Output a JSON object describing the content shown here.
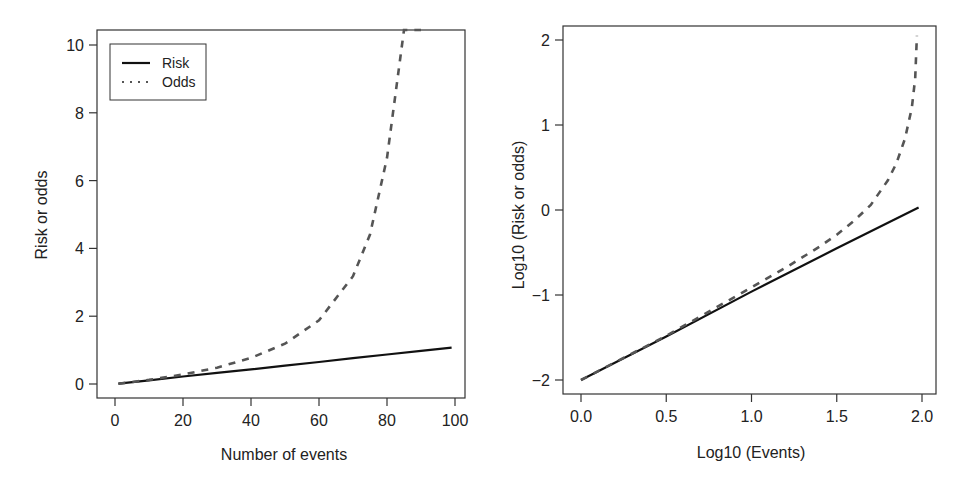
{
  "colors": {
    "risk": "#111111",
    "odds": "#555555",
    "axis": "#333333"
  },
  "chart_data": [
    {
      "type": "line",
      "panel": "left",
      "title": "",
      "xlabel": "Number of events",
      "ylabel": "Risk or odds",
      "xlim": [
        1,
        100
      ],
      "ylim": [
        0,
        10.4
      ],
      "xticks": [
        0,
        20,
        40,
        60,
        80,
        100
      ],
      "yticks": [
        0,
        2,
        4,
        6,
        8,
        10
      ],
      "xtick_labels": [
        "0",
        "20",
        "40",
        "60",
        "80",
        "100"
      ],
      "ytick_labels": [
        "0",
        "2",
        "4",
        "6",
        "8",
        "10"
      ],
      "grid": false,
      "legend": {
        "position": "top-left",
        "entries": [
          "Risk",
          "Odds"
        ]
      },
      "series": [
        {
          "name": "Risk",
          "style": "solid",
          "x": [
            1,
            10,
            20,
            30,
            40,
            50,
            60,
            70,
            80,
            90,
            99
          ],
          "y": [
            0.01,
            0.11,
            0.22,
            0.33,
            0.43,
            0.54,
            0.65,
            0.76,
            0.87,
            0.98,
            1.07
          ]
        },
        {
          "name": "Odds",
          "style": "dashed",
          "x": [
            1,
            10,
            20,
            30,
            40,
            50,
            60,
            70,
            75,
            80,
            85,
            88,
            90
          ],
          "y": [
            0.01,
            0.12,
            0.28,
            0.48,
            0.77,
            1.19,
            1.88,
            3.18,
            4.41,
            6.67,
            11.0,
            20.0,
            45.0
          ]
        }
      ]
    },
    {
      "type": "line",
      "panel": "right",
      "title": "",
      "xlabel": "Log10 (Events)",
      "ylabel": "Log10 (Risk or odds)",
      "xlim": [
        0,
        2.0
      ],
      "ylim": [
        -2,
        2.1
      ],
      "xticks": [
        0.0,
        0.5,
        1.0,
        1.5,
        2.0
      ],
      "yticks": [
        -2,
        -1,
        0,
        1,
        2
      ],
      "xtick_labels": [
        "0.0",
        "0.5",
        "1.0",
        "1.5",
        "2.0"
      ],
      "ytick_labels": [
        "−2",
        "−1",
        "0",
        "1",
        "2"
      ],
      "grid": false,
      "series": [
        {
          "name": "Risk",
          "style": "solid",
          "x": [
            0.0,
            0.5,
            1.0,
            1.5,
            1.98
          ],
          "y": [
            -2.0,
            -1.49,
            -0.96,
            -0.45,
            0.03
          ]
        },
        {
          "name": "Odds",
          "style": "dashed",
          "x": [
            0.0,
            0.5,
            1.0,
            1.2,
            1.4,
            1.5,
            1.6,
            1.7,
            1.8,
            1.85,
            1.9,
            1.94,
            1.96,
            1.97
          ],
          "y": [
            -2.0,
            -1.48,
            -0.91,
            -0.68,
            -0.43,
            -0.29,
            -0.13,
            0.06,
            0.35,
            0.55,
            0.84,
            1.2,
            1.55,
            2.05
          ]
        }
      ]
    }
  ]
}
